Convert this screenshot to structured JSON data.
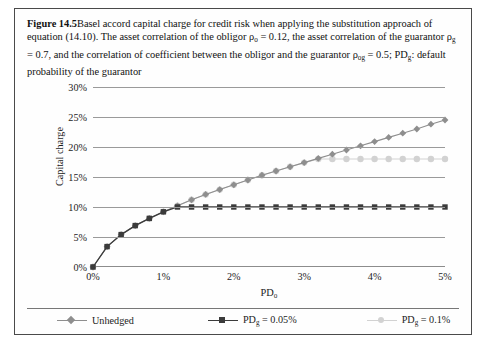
{
  "figure": {
    "label": "Figure 14.5",
    "caption_part1": "Basel accord capital charge for credit risk when applying the substitution approach of equation (14.10). The asset correlation of the obligor ρ",
    "caption_sub1": "o",
    "caption_part2": " = 0.12, the asset correlation of the guarantor ρ",
    "caption_sub2": "g",
    "caption_part3": " = 0.7, and the correlation of coefficient between the obligor and the guarantor ρ",
    "caption_sub3": "og",
    "caption_part4": " = 0.5; PD",
    "caption_sub4": "g",
    "caption_part5": ": default probability of the guarantor"
  },
  "colors": {
    "unhedged": "#8e8e8e",
    "pd005": "#3b3b3b",
    "pd01": "#d2d2d2",
    "grid": "#9a9a9a",
    "axis": "#8c8c8c",
    "frame": "#4a4a4a",
    "text": "#1c1c1c"
  },
  "axis": {
    "x_label_text": "PD",
    "x_label_sub": "o",
    "y_label": "Capital charge",
    "y_ticks": [
      "0%",
      "5%",
      "10%",
      "15%",
      "20%",
      "25%",
      "30%"
    ],
    "x_ticks": [
      "0%",
      "1%",
      "2%",
      "3%",
      "4%",
      "5%"
    ]
  },
  "legend": {
    "items": [
      {
        "label": "Unhedged",
        "marker": "diamond",
        "color": "#8e8e8e"
      },
      {
        "label_text": "PD",
        "label_sub": "g",
        "label_tail": " = 0.05%",
        "marker": "square",
        "color": "#3b3b3b"
      },
      {
        "label_text": "PD",
        "label_sub": "g",
        "label_tail": " = 0.1%",
        "marker": "circle",
        "color": "#d2d2d2"
      }
    ]
  },
  "chart_data": {
    "type": "line",
    "title": "Basel accord capital charge for credit risk when applying the substitution approach",
    "xlabel": "PD_o",
    "ylabel": "Capital charge",
    "xlim": [
      0,
      5
    ],
    "ylim": [
      0,
      30
    ],
    "x_unit": "%",
    "y_unit": "%",
    "grid": true,
    "legend_position": "bottom",
    "x": [
      0.0,
      0.2,
      0.4,
      0.6,
      0.8,
      1.0,
      1.2,
      1.4,
      1.6,
      1.8,
      2.0,
      2.2,
      2.4,
      2.6,
      2.8,
      3.0,
      3.2,
      3.4,
      3.6,
      3.8,
      4.0,
      4.2,
      4.4,
      4.6,
      4.8,
      5.0
    ],
    "series": [
      {
        "name": "Unhedged",
        "marker": "diamond",
        "color": "#8e8e8e",
        "values": [
          0.0,
          3.4,
          5.4,
          6.9,
          8.1,
          9.2,
          10.2,
          11.2,
          12.1,
          12.9,
          13.7,
          14.5,
          15.3,
          16.0,
          16.7,
          17.4,
          18.1,
          18.8,
          19.5,
          20.2,
          20.9,
          21.6,
          22.3,
          23.0,
          23.8,
          24.5
        ]
      },
      {
        "name": "PD_g = 0.05%",
        "marker": "square",
        "color": "#3b3b3b",
        "values": [
          0.0,
          3.4,
          5.4,
          6.9,
          8.1,
          9.2,
          10.0,
          10.0,
          10.0,
          10.0,
          10.0,
          10.0,
          10.0,
          10.0,
          10.0,
          10.0,
          10.0,
          10.0,
          10.0,
          10.0,
          10.0,
          10.0,
          10.0,
          10.0,
          10.0,
          10.0
        ]
      },
      {
        "name": "PD_g = 0.1%",
        "marker": "circle",
        "color": "#d2d2d2",
        "values": [
          0.0,
          3.4,
          5.4,
          6.9,
          8.1,
          9.2,
          10.2,
          11.2,
          12.1,
          12.9,
          13.7,
          14.5,
          15.3,
          16.0,
          16.7,
          17.4,
          18.0,
          18.0,
          18.0,
          18.0,
          18.0,
          18.0,
          18.0,
          18.0,
          18.0,
          18.0
        ]
      }
    ],
    "notes": [
      "Unhedged series continues rising to ~27% at PD_o = 5% (rendered to right edge).",
      "PD_g = 0.05% series plateaus at 10% after PD_o ≈ 1.3%.",
      "PD_g = 0.1% series plateaus at 18% after PD_o ≈ 3.1%."
    ]
  }
}
